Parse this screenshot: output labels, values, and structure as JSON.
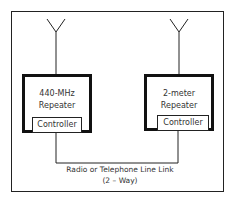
{
  "diagram": {
    "left_repeater": {
      "title_line1": "440-MHz",
      "title_line2": "Repeater",
      "controller_label": "Controller",
      "antenna_icon": "antenna-icon"
    },
    "right_repeater": {
      "title_line1": "2-meter",
      "title_line2": "Repeater",
      "controller_label": "Controller",
      "antenna_icon": "antenna-icon"
    },
    "link": {
      "label_line1": "Radio or Telephone Line Link",
      "label_line2": "(2 – Way)"
    },
    "colors": {
      "line": "#222222",
      "background": "#ffffff"
    }
  }
}
